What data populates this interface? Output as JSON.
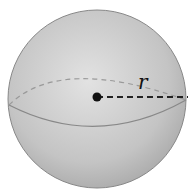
{
  "diagram": {
    "label_radius": "r",
    "colors": {
      "sphere": "#c8c8c8",
      "line": "#222222"
    }
  }
}
